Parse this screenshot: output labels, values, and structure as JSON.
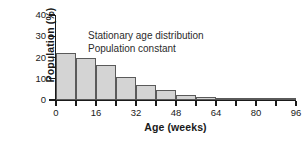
{
  "chart_data": {
    "type": "bar",
    "title": "",
    "xlabel": "Age (weeks)",
    "ylabel": "Population (%)",
    "xlim": [
      0,
      96
    ],
    "ylim": [
      0,
      40
    ],
    "grid": false,
    "legend": null,
    "bar_width_weeks": 8,
    "x_tick_values": [
      0,
      16,
      32,
      48,
      64,
      80,
      96
    ],
    "x_tick_labels": [
      "0",
      "16",
      "32",
      "48",
      "64",
      "80",
      "96"
    ],
    "x_minor_tick_values": [
      8,
      24,
      40,
      56,
      72,
      88
    ],
    "y_tick_values": [
      0,
      10,
      20,
      30,
      40
    ],
    "y_tick_labels": [
      "0",
      "10",
      "20",
      "30",
      "40"
    ],
    "categories": [
      "0-8",
      "8-16",
      "16-24",
      "24-32",
      "32-40",
      "40-48",
      "48-56",
      "56-64",
      "64-72",
      "72-80",
      "80-88",
      "88-96"
    ],
    "bin_starts": [
      0,
      8,
      16,
      24,
      32,
      40,
      48,
      56,
      64,
      72,
      80,
      88
    ],
    "values": [
      22,
      20,
      16.5,
      11,
      7,
      4.5,
      2.5,
      1.5,
      1,
      0.8,
      0.5,
      0.3
    ],
    "annotations": [
      "Stationary age distribution",
      "Population constant"
    ],
    "bar_fill_color": "#d4d4d4",
    "bar_edge_color": "#5a5a5a",
    "axis_color": "#1a1a1a",
    "background_color": "#ffffff"
  }
}
